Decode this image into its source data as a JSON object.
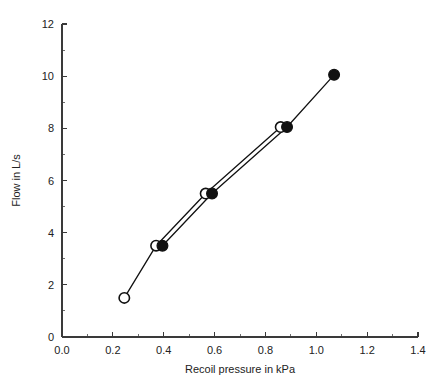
{
  "chart_data": {
    "type": "scatter",
    "title": "",
    "subtitle": "",
    "xlabel": "Recoil pressure in kPa",
    "ylabel": "Flow in L/s",
    "xlim": [
      0.0,
      1.4
    ],
    "ylim": [
      0,
      12
    ],
    "grid": false,
    "legend": "none",
    "xticks": [
      0.0,
      0.2,
      0.4,
      0.6,
      0.8,
      1.0,
      1.2,
      1.4
    ],
    "xticklabels": [
      "0.0",
      "0.2",
      "0.4",
      "0.6",
      "0.8",
      "1.0",
      "1.2",
      "1.4"
    ],
    "xminorticks": [
      0.1,
      0.3,
      0.5,
      0.7,
      0.9,
      1.1,
      1.3
    ],
    "yticks": [
      0,
      2,
      4,
      6,
      8,
      10,
      12
    ],
    "yticklabels": [
      "0",
      "2",
      "4",
      "6",
      "8",
      "10",
      "12"
    ],
    "yminorticks": [
      1,
      3,
      5,
      7,
      9,
      11
    ],
    "series": [
      {
        "name": "open-circle-series",
        "marker": "open-circle",
        "marker_face_color": "#ffffff",
        "marker_edge_color": "#111111",
        "line_color": "#111111",
        "x": [
          0.245,
          0.37,
          0.565,
          0.86
        ],
        "y": [
          1.5,
          3.5,
          5.5,
          8.05
        ]
      },
      {
        "name": "filled-circle-series",
        "marker": "filled-circle",
        "marker_face_color": "#111111",
        "marker_edge_color": "#111111",
        "line_color": "#111111",
        "x": [
          0.395,
          0.59,
          0.885,
          1.07
        ],
        "y": [
          3.5,
          5.5,
          8.05,
          10.05
        ]
      }
    ]
  },
  "figure": {
    "background_color": "#ffffff",
    "axis_color": "#3a3a3a",
    "text_color": "#222222"
  }
}
